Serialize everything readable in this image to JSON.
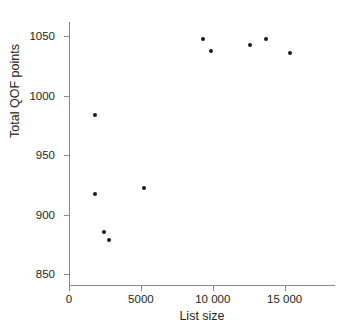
{
  "figure": {
    "clipped_title": "",
    "background_color": "#ffffff",
    "marker_color": "#1a1a1a",
    "axis_color": "#8a8a8d",
    "text_color": "#231f20"
  },
  "axes": {
    "y_title": "Total QOF points",
    "x_title": "List size",
    "y_tick_labels": [
      "1050",
      "1000",
      "950",
      "900",
      "850"
    ],
    "x_tick_labels": [
      "0",
      "5000",
      "10 000",
      "15 000"
    ]
  },
  "chart_data": {
    "type": "scatter",
    "title": "",
    "xlabel": "List size",
    "ylabel": "Total QOF points",
    "xlim": [
      0,
      18500
    ],
    "ylim": [
      840,
      1062
    ],
    "xticks": [
      0,
      5000,
      10000,
      15000
    ],
    "yticks": [
      850,
      900,
      950,
      1000,
      1050
    ],
    "xtick_labels": [
      "0",
      "5000",
      "10 000",
      "15 000"
    ],
    "ytick_labels": [
      "850",
      "900",
      "950",
      "1000",
      "1050"
    ],
    "grid": false,
    "legend": null,
    "n_points": 11,
    "x": [
      1800,
      1800,
      2400,
      2800,
      5200,
      9300,
      9900,
      12600,
      13700,
      15400,
      9300
    ],
    "y": [
      984,
      917,
      885,
      879,
      922,
      1048,
      1038,
      1043,
      1048,
      1036,
      1048
    ],
    "points": [
      {
        "x": 1800,
        "y": 984
      },
      {
        "x": 1800,
        "y": 917
      },
      {
        "x": 2400,
        "y": 885
      },
      {
        "x": 2800,
        "y": 879
      },
      {
        "x": 5200,
        "y": 922
      },
      {
        "x": 9300,
        "y": 1048
      },
      {
        "x": 9900,
        "y": 1038
      },
      {
        "x": 12600,
        "y": 1043
      },
      {
        "x": 13700,
        "y": 1048
      },
      {
        "x": 15400,
        "y": 1036
      }
    ]
  }
}
